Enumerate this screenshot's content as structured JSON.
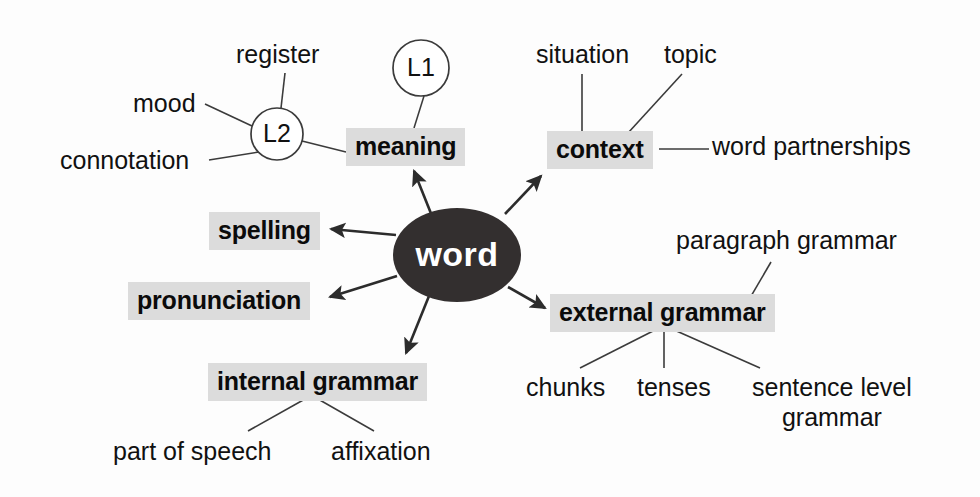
{
  "diagram": {
    "title": "word",
    "type": "mind-map",
    "background_color": "#fdfdfd",
    "hub": {
      "label": "word",
      "fill_color": "#332f2f",
      "text_color": "#ffffff",
      "cx": 457,
      "cy": 255,
      "rx": 64,
      "ry": 47
    },
    "highlight_color": "#dcdcdc",
    "branches": [
      {
        "id": "meaning",
        "label": "meaning",
        "style": "highlighted",
        "x": 346,
        "y": 128,
        "children": [
          {
            "id": "l1",
            "label": "L1",
            "style": "circle",
            "cx": 421,
            "cy": 68,
            "r": 28,
            "children": []
          },
          {
            "id": "l2",
            "label": "L2",
            "style": "circle",
            "cx": 277,
            "cy": 134,
            "r": 26,
            "children": [
              {
                "id": "register",
                "label": "register",
                "style": "plain",
                "x": 236,
                "y": 40
              },
              {
                "id": "mood",
                "label": "mood",
                "style": "plain",
                "x": 133,
                "y": 89
              },
              {
                "id": "connotation",
                "label": "connotation",
                "style": "plain",
                "x": 60,
                "y": 146
              }
            ]
          }
        ]
      },
      {
        "id": "context",
        "label": "context",
        "style": "highlighted",
        "x": 547,
        "y": 131,
        "children": [
          {
            "id": "situation",
            "label": "situation",
            "style": "plain",
            "x": 536,
            "y": 40
          },
          {
            "id": "topic",
            "label": "topic",
            "style": "plain",
            "x": 664,
            "y": 40
          },
          {
            "id": "word-partnerships",
            "label": "word partnerships",
            "style": "plain",
            "x": 712,
            "y": 132
          }
        ]
      },
      {
        "id": "spelling",
        "label": "spelling",
        "style": "highlighted",
        "x": 209,
        "y": 212,
        "children": []
      },
      {
        "id": "pronunciation",
        "label": "pronunciation",
        "style": "highlighted",
        "x": 128,
        "y": 282,
        "children": []
      },
      {
        "id": "internal-grammar",
        "label": "internal grammar",
        "style": "highlighted",
        "x": 208,
        "y": 363,
        "children": [
          {
            "id": "part-of-speech",
            "label": "part of speech",
            "style": "plain",
            "x": 113,
            "y": 437
          },
          {
            "id": "affixation",
            "label": "affixation",
            "style": "plain",
            "x": 331,
            "y": 437
          }
        ]
      },
      {
        "id": "external-grammar",
        "label": "external grammar",
        "style": "highlighted",
        "x": 550,
        "y": 294,
        "children": [
          {
            "id": "paragraph-grammar",
            "label": "paragraph grammar",
            "style": "plain",
            "x": 676,
            "y": 226
          },
          {
            "id": "chunks",
            "label": "chunks",
            "style": "plain",
            "x": 526,
            "y": 373
          },
          {
            "id": "tenses",
            "label": "tenses",
            "style": "plain",
            "x": 637,
            "y": 373
          },
          {
            "id": "sentence-level-grammar",
            "label": "sentence level\ngrammar",
            "line1": "sentence level",
            "line2": "grammar",
            "style": "plain",
            "x": 752,
            "y": 373
          }
        ]
      }
    ]
  }
}
